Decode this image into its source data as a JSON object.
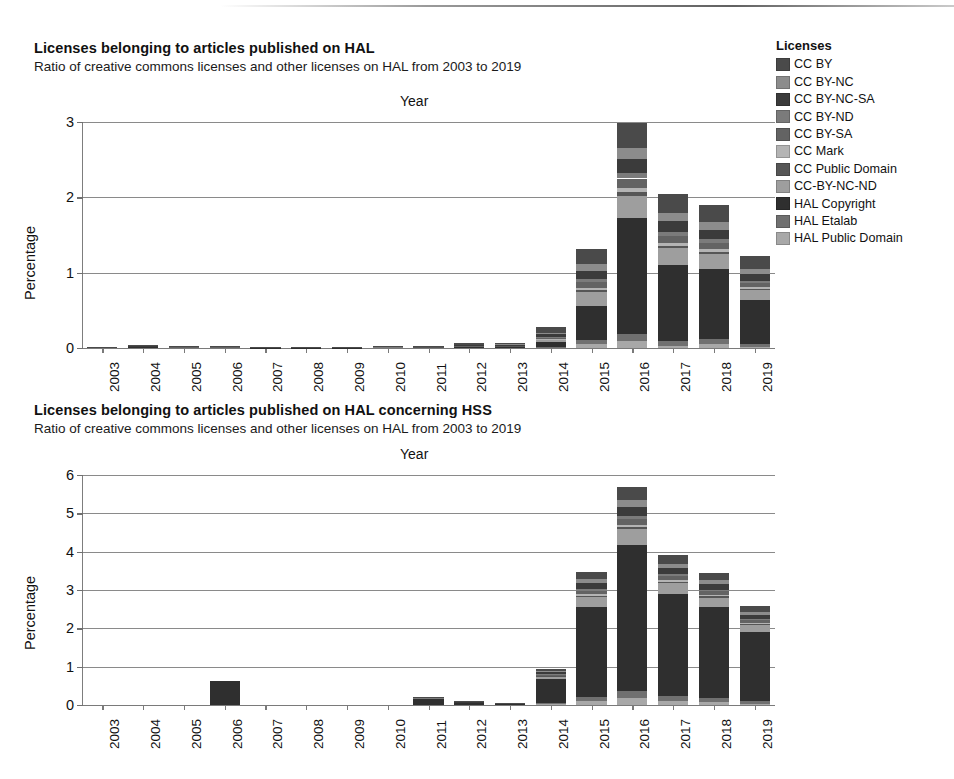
{
  "document": {
    "kind": "scanned-figure-page",
    "license_names": [
      "CC BY",
      "CC BY-NC",
      "CC BY-NC-SA",
      "CC BY-ND",
      "CC BY-SA",
      "CC Mark",
      "CC Public Domain",
      "CC-BY-NC-ND",
      "HAL Copyright",
      "HAL Etalab",
      "HAL Public Domain"
    ],
    "license_colors": [
      "#4a4a4a",
      "#8c8c8c",
      "#3b3b3b",
      "#7b7b7b",
      "#636363",
      "#b4b4b4",
      "#565656",
      "#9e9e9e",
      "#2f2f2f",
      "#707070",
      "#a8a8a8"
    ]
  },
  "legend": {
    "title": "Licenses",
    "position": "right",
    "items": [
      {
        "label": "CC BY",
        "color": "#4a4a4a"
      },
      {
        "label": "CC BY-NC",
        "color": "#8c8c8c"
      },
      {
        "label": "CC BY-NC-SA",
        "color": "#3b3b3b"
      },
      {
        "label": "CC BY-ND",
        "color": "#7b7b7b"
      },
      {
        "label": "CC BY-SA",
        "color": "#636363"
      },
      {
        "label": "CC Mark",
        "color": "#b4b4b4"
      },
      {
        "label": "CC Public Domain",
        "color": "#565656"
      },
      {
        "label": "CC-BY-NC-ND",
        "color": "#9e9e9e"
      },
      {
        "label": "HAL Copyright",
        "color": "#2f2f2f"
      },
      {
        "label": "HAL Etalab",
        "color": "#707070"
      },
      {
        "label": "HAL Public Domain",
        "color": "#a8a8a8"
      }
    ]
  },
  "chart_data": [
    {
      "id": "chart-hal-all",
      "type": "bar",
      "stacked": true,
      "title": "Licenses belonging to articles published on HAL",
      "subtitle": "Ratio of creative commons licenses and other licenses on HAL from 2003 to 2019",
      "xlabel": "Year",
      "ylabel": "Percentage",
      "xlabel_position": "top",
      "ylim": [
        0,
        3
      ],
      "yticks": [
        0,
        1,
        2,
        3
      ],
      "ytick_labels": [
        "0",
        "1",
        "2",
        "3"
      ],
      "grid": true,
      "categories": [
        "2003",
        "2004",
        "2005",
        "2006",
        "2007",
        "2008",
        "2009",
        "2010",
        "2011",
        "2012",
        "2013",
        "2014",
        "2015",
        "2016",
        "2017",
        "2018",
        "2019"
      ],
      "totals": [
        0.01,
        0.04,
        0.02,
        0.02,
        0.01,
        0.01,
        0.01,
        0.02,
        0.03,
        0.06,
        0.07,
        0.28,
        1.31,
        2.89,
        2.04,
        1.88,
        1.23
      ],
      "series": [
        {
          "name": "CC BY",
          "color": "#4a4a4a",
          "values": [
            0.004,
            0.01,
            0.006,
            0.006,
            0.004,
            0.004,
            0.004,
            0.006,
            0.01,
            0.018,
            0.02,
            0.075,
            0.2,
            0.33,
            0.25,
            0.23,
            0.17
          ]
        },
        {
          "name": "CC BY-NC",
          "color": "#8c8c8c",
          "values": [
            0.001,
            0.004,
            0.002,
            0.002,
            0.001,
            0.001,
            0.001,
            0.002,
            0.003,
            0.006,
            0.007,
            0.025,
            0.09,
            0.15,
            0.11,
            0.1,
            0.07
          ]
        },
        {
          "name": "CC BY-NC-SA",
          "color": "#3b3b3b",
          "values": [
            0.001,
            0.005,
            0.002,
            0.002,
            0.001,
            0.001,
            0.001,
            0.002,
            0.004,
            0.007,
            0.008,
            0.03,
            0.11,
            0.19,
            0.14,
            0.125,
            0.085
          ]
        },
        {
          "name": "CC BY-ND",
          "color": "#7b7b7b",
          "values": [
            0.0,
            0.002,
            0.001,
            0.001,
            0.0,
            0.0,
            0.0,
            0.001,
            0.001,
            0.003,
            0.003,
            0.01,
            0.04,
            0.07,
            0.05,
            0.045,
            0.03
          ]
        },
        {
          "name": "CC BY-SA",
          "color": "#636363",
          "values": [
            0.001,
            0.003,
            0.002,
            0.002,
            0.001,
            0.001,
            0.001,
            0.002,
            0.003,
            0.005,
            0.006,
            0.02,
            0.075,
            0.13,
            0.095,
            0.085,
            0.055
          ]
        },
        {
          "name": "CC Mark",
          "color": "#b4b4b4",
          "values": [
            0.0,
            0.001,
            0.001,
            0.001,
            0.0,
            0.0,
            0.0,
            0.001,
            0.001,
            0.002,
            0.002,
            0.008,
            0.03,
            0.055,
            0.04,
            0.035,
            0.025
          ]
        },
        {
          "name": "CC Public Domain",
          "color": "#565656",
          "values": [
            0.0,
            0.001,
            0.0,
            0.0,
            0.0,
            0.0,
            0.0,
            0.0,
            0.001,
            0.001,
            0.002,
            0.006,
            0.025,
            0.045,
            0.032,
            0.03,
            0.02
          ]
        },
        {
          "name": "CC-BY-NC-ND",
          "color": "#9e9e9e",
          "values": [
            0.001,
            0.004,
            0.002,
            0.002,
            0.001,
            0.001,
            0.001,
            0.002,
            0.003,
            0.006,
            0.007,
            0.026,
            0.18,
            0.3,
            0.215,
            0.2,
            0.13
          ]
        },
        {
          "name": "HAL Copyright",
          "color": "#2f2f2f",
          "values": [
            0.001,
            0.007,
            0.003,
            0.003,
            0.001,
            0.001,
            0.001,
            0.003,
            0.004,
            0.008,
            0.01,
            0.065,
            0.45,
            1.53,
            1.01,
            0.93,
            0.58
          ]
        },
        {
          "name": "HAL Etalab",
          "color": "#707070",
          "values": [
            0.0,
            0.002,
            0.001,
            0.001,
            0.0,
            0.0,
            0.0,
            0.001,
            0.001,
            0.002,
            0.003,
            0.008,
            0.06,
            0.1,
            0.07,
            0.065,
            0.04
          ]
        },
        {
          "name": "HAL Public Domain",
          "color": "#a8a8a8",
          "values": [
            0.001,
            0.001,
            0.001,
            0.001,
            0.0,
            0.0,
            0.0,
            0.0,
            0.001,
            0.002,
            0.002,
            0.007,
            0.05,
            0.09,
            0.028,
            0.055,
            0.015
          ]
        }
      ]
    },
    {
      "id": "chart-hal-hss",
      "type": "bar",
      "stacked": true,
      "title": "Licenses belonging to articles published on HAL concerning HSS",
      "subtitle": "Ratio of creative commons licenses and other licenses on HAL from 2003 to 2019",
      "xlabel": "Year",
      "ylabel": "Percentage",
      "xlabel_position": "top",
      "ylim": [
        0,
        6
      ],
      "yticks": [
        0,
        1,
        2,
        3,
        4,
        5,
        6
      ],
      "ytick_labels": [
        "0",
        "1",
        "2",
        "3",
        "4",
        "5",
        "6"
      ],
      "grid": true,
      "categories": [
        "2003",
        "2004",
        "2005",
        "2006",
        "2007",
        "2008",
        "2009",
        "2010",
        "2011",
        "2012",
        "2013",
        "2014",
        "2015",
        "2016",
        "2017",
        "2018",
        "2019"
      ],
      "totals": [
        0.0,
        0.0,
        0.0,
        0.62,
        0.0,
        0.0,
        0.0,
        0.0,
        0.2,
        0.08,
        0.03,
        0.95,
        3.48,
        5.68,
        3.92,
        3.44,
        2.58
      ],
      "series": [
        {
          "name": "CC BY",
          "color": "#4a4a4a",
          "values": [
            0,
            0,
            0,
            0.0,
            0,
            0,
            0,
            0,
            0.01,
            0.004,
            0.002,
            0.06,
            0.2,
            0.33,
            0.23,
            0.2,
            0.15
          ]
        },
        {
          "name": "CC BY-NC",
          "color": "#8c8c8c",
          "values": [
            0,
            0,
            0,
            0.0,
            0,
            0,
            0,
            0,
            0.006,
            0.003,
            0.001,
            0.035,
            0.11,
            0.18,
            0.12,
            0.105,
            0.08
          ]
        },
        {
          "name": "CC BY-NC-SA",
          "color": "#3b3b3b",
          "values": [
            0,
            0,
            0,
            0.0,
            0,
            0,
            0,
            0,
            0.008,
            0.004,
            0.002,
            0.045,
            0.14,
            0.23,
            0.155,
            0.135,
            0.1
          ]
        },
        {
          "name": "CC BY-ND",
          "color": "#7b7b7b",
          "values": [
            0,
            0,
            0,
            0.0,
            0,
            0,
            0,
            0,
            0.002,
            0.001,
            0.001,
            0.015,
            0.05,
            0.08,
            0.055,
            0.048,
            0.035
          ]
        },
        {
          "name": "CC BY-SA",
          "color": "#636363",
          "values": [
            0,
            0,
            0,
            0.0,
            0,
            0,
            0,
            0,
            0.005,
            0.002,
            0.001,
            0.03,
            0.095,
            0.155,
            0.105,
            0.092,
            0.068
          ]
        },
        {
          "name": "CC Mark",
          "color": "#b4b4b4",
          "values": [
            0,
            0,
            0,
            0.0,
            0,
            0,
            0,
            0,
            0.002,
            0.001,
            0.001,
            0.012,
            0.04,
            0.065,
            0.044,
            0.038,
            0.028
          ]
        },
        {
          "name": "CC Public Domain",
          "color": "#565656",
          "values": [
            0,
            0,
            0,
            0.0,
            0,
            0,
            0,
            0,
            0.002,
            0.001,
            0.0,
            0.01,
            0.033,
            0.053,
            0.036,
            0.031,
            0.023
          ]
        },
        {
          "name": "CC-BY-NC-ND",
          "color": "#9e9e9e",
          "values": [
            0,
            0,
            0,
            0.0,
            0,
            0,
            0,
            0,
            0.012,
            0.005,
            0.002,
            0.075,
            0.25,
            0.42,
            0.28,
            0.245,
            0.18
          ]
        },
        {
          "name": "HAL Copyright",
          "color": "#2f2f2f",
          "values": [
            0,
            0,
            0,
            0.62,
            0,
            0,
            0,
            0,
            0.14,
            0.055,
            0.018,
            0.62,
            2.35,
            3.8,
            2.66,
            2.38,
            1.8
          ]
        },
        {
          "name": "HAL Etalab",
          "color": "#707070",
          "values": [
            0,
            0,
            0,
            0.0,
            0,
            0,
            0,
            0,
            0.008,
            0.003,
            0.001,
            0.03,
            0.105,
            0.19,
            0.13,
            0.11,
            0.08
          ]
        },
        {
          "name": "HAL Public Domain",
          "color": "#a8a8a8",
          "values": [
            0,
            0,
            0,
            0.0,
            0,
            0,
            0,
            0,
            0.005,
            0.001,
            0.001,
            0.018,
            0.107,
            0.177,
            0.105,
            0.066,
            0.036
          ]
        }
      ]
    }
  ]
}
